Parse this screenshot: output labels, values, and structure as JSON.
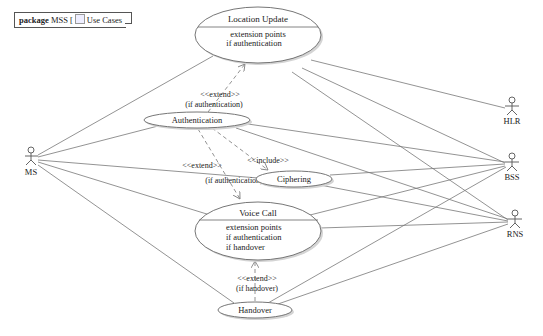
{
  "package": {
    "keyword": "package",
    "name": "MSS",
    "diagram_label": "Use Cases",
    "diagram_icon": "use-case-diagram-icon"
  },
  "use_cases": {
    "location_update": {
      "name": "Location Update",
      "ext_header": "extension points",
      "ext_points": [
        "if authentication"
      ]
    },
    "authentication": {
      "name": "Authentication"
    },
    "ciphering": {
      "name": "Ciphering"
    },
    "voice_call": {
      "name": "Voice Call",
      "ext_header": "extension points",
      "ext_points": [
        "if authentication",
        "if handover"
      ]
    },
    "handover": {
      "name": "Handover"
    }
  },
  "actors": {
    "ms": "MS",
    "hlr": "HLR",
    "bss": "BSS",
    "rns": "RNS"
  },
  "relationships": {
    "auth_extends_lu": {
      "stereotype": "<<extend>>",
      "condition": "(if authentication)"
    },
    "auth_extends_vc": {
      "stereotype": "<<extend>>",
      "condition": "(if authentication)"
    },
    "auth_includes_ciph": {
      "stereotype": "<<include>>"
    },
    "ho_extends_vc": {
      "stereotype": "<<extend>>",
      "condition": "(if handover)"
    }
  },
  "colors": {
    "line": "#777777",
    "ellipse_fill": "#ffffff",
    "ellipse_stroke": "#666666",
    "shadow": "#d4d4d4",
    "text": "#222222"
  }
}
